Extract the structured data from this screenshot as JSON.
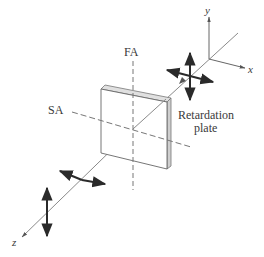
{
  "diagram": {
    "type": "optics-schematic",
    "labels": {
      "fast_axis": "FA",
      "slow_axis": "SA",
      "plate_line1": "Retardation",
      "plate_line2": "plate",
      "axis_x": "x",
      "axis_y": "y",
      "axis_z": "z"
    },
    "colors": {
      "line": "#555555",
      "arrow": "#2a2a2a",
      "plate_edge": "#c8c8c8",
      "plate_face": "#ffffff",
      "text": "#3a3a3a"
    },
    "elements": [
      {
        "id": "coordinate-axes",
        "note": "x, y axes at top right; z axis diagonal toward lower left"
      },
      {
        "id": "input-polarization",
        "note": "crossed double-headed arrows (horizontal & vertical) before plate"
      },
      {
        "id": "retardation-plate",
        "note": "thin square plate with fast axis (vertical) and slow axis (horizontal) dashed"
      },
      {
        "id": "output-polarization",
        "note": "separated horizontal and vertical double-headed arrows after plate"
      }
    ]
  }
}
